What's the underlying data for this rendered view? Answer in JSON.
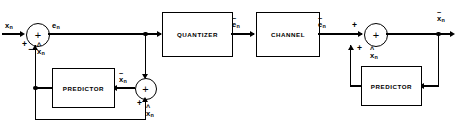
{
  "diagram": {
    "stroke_color": "#000000",
    "background_color": "#ffffff"
  },
  "blocks": [
    {
      "id": "quantizer",
      "label": "QUANTIZER"
    },
    {
      "id": "channel",
      "label": "CHANNEL"
    },
    {
      "id": "predictor_left",
      "label": "PREDICTOR"
    },
    {
      "id": "predictor_right",
      "label": "PREDICTOR"
    }
  ],
  "summers": [
    {
      "id": "summer-left",
      "symbol": "+",
      "inputs": [
        "+",
        "−"
      ]
    },
    {
      "id": "summer-left-bottom",
      "symbol": "+",
      "inputs": [
        "+"
      ]
    },
    {
      "id": "summer-right",
      "symbol": "+",
      "inputs": [
        "+",
        "+"
      ]
    }
  ],
  "signals": {
    "input_x": {
      "base": "x",
      "sub": "n",
      "mark": "",
      "text": "x_n"
    },
    "error_e": {
      "base": "e",
      "sub": "n",
      "mark": "",
      "text": "e_n"
    },
    "pred_left_xhat": {
      "base": "x",
      "sub": "n",
      "mark": "^",
      "text": "x^_n"
    },
    "quantized_e_tilde": {
      "base": "e",
      "sub": "n",
      "mark": "~",
      "text": "e~_n"
    },
    "channel_e_tilde": {
      "base": "e",
      "sub": "n",
      "mark": "~",
      "text": "e~_n"
    },
    "recon_x_tilde_left": {
      "base": "x",
      "sub": "n",
      "mark": "~",
      "text": "x~_n"
    },
    "pred_bottom_xhat": {
      "base": "x",
      "sub": "n",
      "mark": "^",
      "text": "x^_n"
    },
    "pred_right_xhat": {
      "base": "x",
      "sub": "n",
      "mark": "^",
      "text": "x^_n"
    },
    "output_x_tilde": {
      "base": "x",
      "sub": "n",
      "mark": "~",
      "text": "x~_n"
    }
  },
  "signs": {
    "left_plus": "+",
    "left_minus": "−",
    "bottom_plus": "+",
    "right_plus_in": "+",
    "right_plus_fb": "+"
  }
}
